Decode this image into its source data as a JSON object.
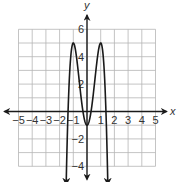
{
  "chart_data": {
    "type": "line",
    "title": "",
    "xlabel": "x",
    "ylabel": "y",
    "xlim": [
      -5,
      5
    ],
    "ylim": [
      -4,
      6
    ],
    "grid": true,
    "grid_step": 1,
    "x_ticks": [
      "-5",
      "-4",
      "-3",
      "-2",
      "-1",
      "1",
      "2",
      "3",
      "4",
      "5"
    ],
    "y_ticks": [
      "6",
      "4",
      "2",
      "-2",
      "-4"
    ],
    "series": [
      {
        "name": "f(x)",
        "description": "quartic with local maxima at (-1,5) and (1,5), local minimum at (0,-1), both ends arrowing down",
        "x": [
          -1.5,
          -1.25,
          -1,
          -0.75,
          -0.5,
          -0.25,
          0,
          0.25,
          0.5,
          0.75,
          1,
          1.25,
          1.5
        ],
        "y": [
          -4.4,
          3.4,
          5,
          3.9,
          1.6,
          -0.3,
          -1,
          -0.3,
          1.6,
          3.9,
          5,
          3.4,
          -4.4
        ]
      }
    ],
    "key_points": {
      "local_max": [
        [
          -1,
          5
        ],
        [
          1,
          5
        ]
      ],
      "local_min": [
        [
          0,
          -1
        ]
      ]
    }
  },
  "colors": {
    "grid": "#b5b5b5",
    "axis": "#1a1a1a",
    "curve": "#1a1a1a"
  }
}
